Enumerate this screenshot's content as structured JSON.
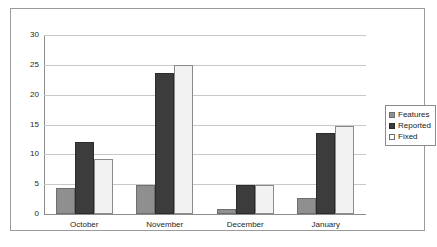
{
  "chart_data": {
    "type": "bar",
    "title": "",
    "xlabel": "",
    "ylabel": "",
    "categories": [
      "October",
      "November",
      "December",
      "January"
    ],
    "series": [
      {
        "name": "Features",
        "color": "#8f8f8f",
        "values": [
          4.3,
          4.9,
          0.9,
          2.7
        ]
      },
      {
        "name": "Reported",
        "color": "#3c3c3c",
        "values": [
          12.0,
          23.6,
          4.8,
          13.5
        ]
      },
      {
        "name": "Fixed",
        "color": "#f2f2f2",
        "values": [
          9.3,
          25.0,
          4.8,
          14.8
        ]
      }
    ],
    "ylim": [
      0,
      30
    ],
    "ytick_values": [
      0,
      5,
      10,
      15,
      20,
      25,
      30
    ],
    "ytick_labels": [
      "0",
      "5",
      "10",
      "15",
      "20",
      "25",
      "30"
    ],
    "grid": true,
    "grid_axis": "y",
    "legend_position": "right",
    "legend_border": true,
    "plot_background": "#ffffff",
    "gridline_color": "#c8c8c8",
    "axis_color": "#8c8c8c",
    "frame_border_color": "#9a9a9a"
  }
}
